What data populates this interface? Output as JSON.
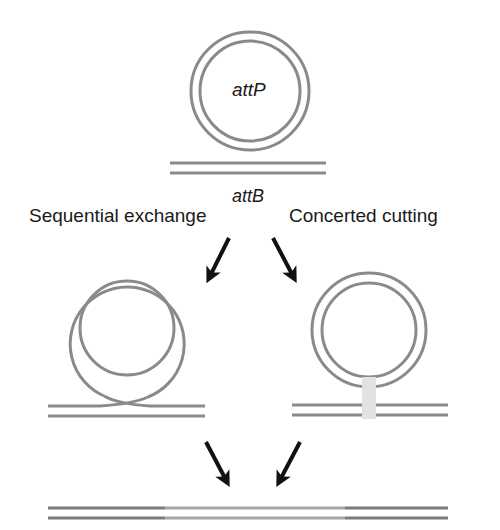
{
  "labels": {
    "attP": "attP",
    "attB": "attB",
    "left_pathway": "Sequential exchange",
    "right_pathway": "Concerted cutting"
  },
  "colors": {
    "dna_strand": "#8a8a8a",
    "dna_strand_dark": "#7a7a7a",
    "dna_strand_light": "#a6a6a6",
    "arrow": "#111111",
    "cut_block": "#e2e2e2",
    "text": "#1a1a1a"
  },
  "elements": {
    "top_circle": "attP plasmid circle (double-stranded)",
    "top_line": "attB linear duplex",
    "left_intermediate": "Sequential exchange intermediate (crossed strands)",
    "right_intermediate": "Concerted cutting intermediate (cut region)",
    "product": "Integrated product duplex"
  }
}
